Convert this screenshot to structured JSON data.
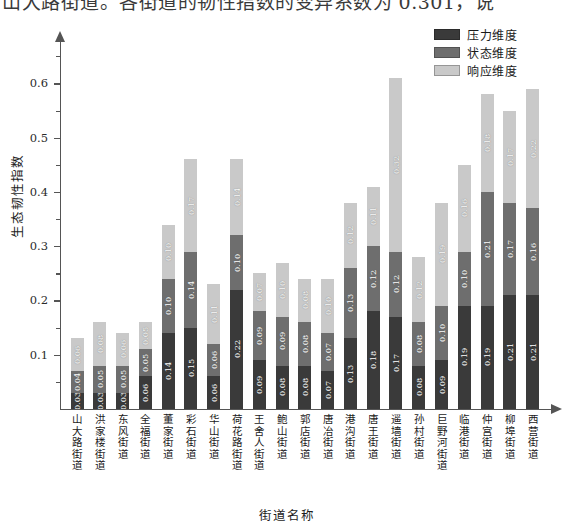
{
  "top_text": "山大路街道。各街道的韧性指数的变异系数为 0.301，说",
  "chart_data": {
    "type": "bar",
    "stacked": true,
    "title": "",
    "xlabel": "街道名称",
    "ylabel": "生态韧性指数",
    "ylim": [
      0,
      0.68
    ],
    "ytick_labels": [
      "0.1",
      "0.2",
      "0.3",
      "0.4",
      "0.5",
      "0.6"
    ],
    "ytick_values": [
      0.1,
      0.2,
      0.3,
      0.4,
      0.5,
      0.6
    ],
    "minor_ticks": [
      0.05,
      0.15,
      0.25,
      0.35,
      0.45,
      0.55,
      0.65
    ],
    "grid": false,
    "legend_position": "top-right",
    "categories": [
      "山大路街道",
      "洪家楼街道",
      "东风街道",
      "全福街道",
      "董家街道",
      "彩石街道",
      "华山街道",
      "荷花路街道",
      "王舍人街道",
      "鲍山街道",
      "郭店街道",
      "唐冶街道",
      "港沟街道",
      "唐王街道",
      "遥墙街道",
      "孙村街道",
      "巨野河街道",
      "临港街道",
      "仲宫街道",
      "柳埠街道",
      "西营街道"
    ],
    "series": [
      {
        "name": "压力维度",
        "color": "#3a3a3a",
        "values": [
          0.03,
          0.03,
          0.03,
          0.06,
          0.14,
          0.15,
          0.06,
          0.22,
          0.09,
          0.08,
          0.08,
          0.07,
          0.13,
          0.18,
          0.17,
          0.08,
          0.09,
          0.19,
          0.19,
          0.21,
          0.21
        ],
        "labels": [
          "0.03",
          "0.03",
          "0.03",
          "0.06",
          "0.14",
          "0.15",
          "0.06",
          "0.22",
          "0.09",
          "0.08",
          "0.08",
          "0.07",
          "0.13",
          "0.18",
          "0.17",
          "0.08",
          "0.09",
          "0.19",
          "0.19",
          "0.21",
          "0.21"
        ]
      },
      {
        "name": "状态维度",
        "color": "#6e6e6e",
        "values": [
          0.04,
          0.05,
          0.05,
          0.05,
          0.1,
          0.14,
          0.06,
          0.1,
          0.09,
          0.09,
          0.08,
          0.07,
          0.13,
          0.12,
          0.12,
          0.08,
          0.1,
          0.1,
          0.21,
          0.17,
          0.16
        ],
        "labels": [
          "0.04",
          "0.05",
          "0.05",
          "0.05",
          "0.10",
          "0.14",
          "0.06",
          "0.10",
          "0.09",
          "0.09",
          "0.08",
          "0.07",
          "0.13",
          "0.12",
          "0.12",
          "0.08",
          "0.10",
          "0.10",
          "0.21",
          "0.17",
          "0.16"
        ]
      },
      {
        "name": "响应维度",
        "color": "#c9c9c9",
        "values": [
          0.06,
          0.08,
          0.06,
          0.05,
          0.1,
          0.17,
          0.11,
          0.14,
          0.07,
          0.1,
          0.08,
          0.1,
          0.12,
          0.11,
          0.32,
          0.12,
          0.19,
          0.16,
          0.18,
          0.17,
          0.22
        ],
        "labels": [
          "0.06",
          "0.08",
          "0.06",
          "0.05",
          "0.10",
          "0.17",
          "0.11",
          "0.14",
          "0.07",
          "0.10",
          "0.08",
          "0.10",
          "0.12",
          "0.11",
          "0.32",
          "0.12",
          "0.19",
          "0.16",
          "0.18",
          "0.17",
          "0.22"
        ]
      }
    ],
    "totals": [
      0.13,
      0.16,
      0.14,
      0.16,
      0.34,
      0.46,
      0.23,
      0.46,
      0.25,
      0.27,
      0.24,
      0.24,
      0.38,
      0.41,
      0.61,
      0.28,
      0.38,
      0.45,
      0.58,
      0.55,
      0.59
    ]
  }
}
